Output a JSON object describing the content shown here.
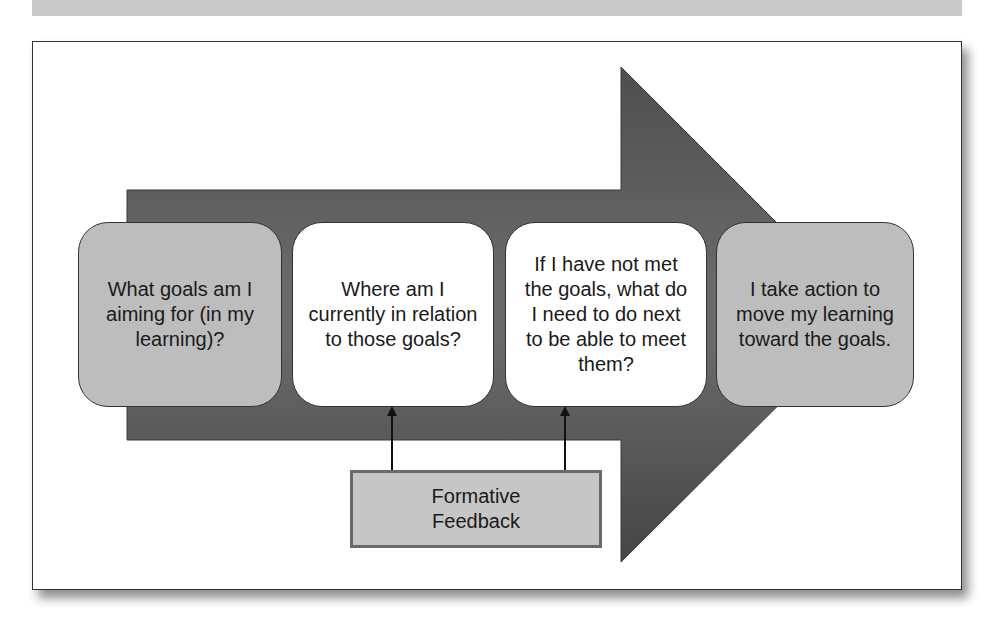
{
  "header": {
    "title": ""
  },
  "diagram": {
    "arrow_color": "#565656",
    "steps": [
      {
        "label": "What goals am I aiming for (in my learning)?",
        "fill": "#bdbdbd"
      },
      {
        "label": "Where am I currently in relation to those goals?",
        "fill": "#ffffff"
      },
      {
        "label": "If I have not met the goals, what do I need to do next to be able to meet them?",
        "fill": "#ffffff"
      },
      {
        "label": "I take action to move my learning toward the goals.",
        "fill": "#bdbdbd"
      }
    ],
    "feedback": {
      "label": "Formative Feedback",
      "fill": "#c6c6c6",
      "targets": [
        "step-2",
        "step-3"
      ]
    }
  }
}
